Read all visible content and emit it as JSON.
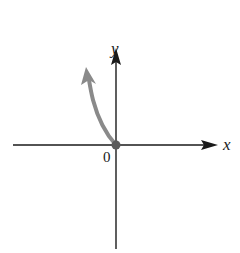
{
  "diagram": {
    "type": "coordinate-axes-with-curve",
    "axes": {
      "x_label": "x",
      "y_label": "y",
      "origin_label": "0",
      "axis_color": "#1a1a1a"
    },
    "curve": {
      "description": "Curve starting at the origin and rising steeply into the second quadrant, ending with an arrowhead",
      "start": "origin",
      "direction": "up-left",
      "color": "#8a8a8a",
      "has_arrowhead": true,
      "origin_marker": "filled dot"
    }
  }
}
